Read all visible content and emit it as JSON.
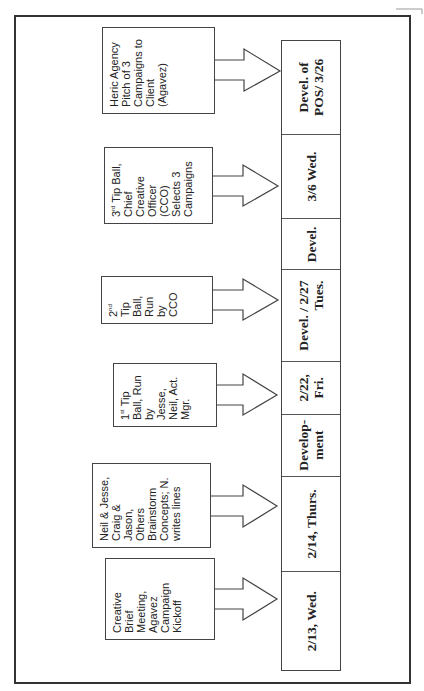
{
  "diagram": {
    "orientation": "rotated-90-ccw",
    "timeline": [
      {
        "label": "2/13, Wed.",
        "width": 99
      },
      {
        "label": "2/14, Thurs.",
        "width": 96
      },
      {
        "label": "Develop-\nment",
        "width": 62
      },
      {
        "label": "2/22,\nFri.",
        "width": 53
      },
      {
        "label": "Devel. / 2/27\nTues.",
        "width": 92
      },
      {
        "label": "Devel.",
        "width": 51
      },
      {
        "label": "3/6 Wed.",
        "width": 85
      },
      {
        "label": "Devel. of\nPOS/ 3/26",
        "width": 93
      }
    ],
    "events": [
      {
        "id": "creative-brief",
        "lines": [
          "Creative",
          "Brief",
          "Meeting,",
          "Agavez",
          "Campaign",
          "Kickoff"
        ],
        "target": "2/13, Wed."
      },
      {
        "id": "brainstorm",
        "lines": [
          "Neil & Jesse,",
          "Craig &",
          "Jason,",
          "Others",
          "Brainstorm",
          "Concepts; N.",
          "writes lines"
        ],
        "target": "2/14, Thurs."
      },
      {
        "id": "tip-ball-1",
        "ordinal": "1",
        "suffix": "st",
        "lines": [
          " Tip",
          "Ball, Run",
          "by",
          "Jesse,",
          "Neil, Act.",
          "Mgr."
        ],
        "target": "2/22, Fri."
      },
      {
        "id": "tip-ball-2",
        "ordinal": "2",
        "suffix": "nd",
        "lines": [
          "",
          "Tip",
          "Ball,",
          "Run",
          "by",
          "CCO"
        ],
        "target": "2/27 Tues."
      },
      {
        "id": "tip-ball-3",
        "ordinal": "3",
        "suffix": "rd",
        "lines": [
          " Tip Ball,",
          "Chief",
          "Creative",
          "Officer",
          "(CCO)",
          "Selects 3",
          "Campaigns"
        ],
        "target": "3/6 Wed."
      },
      {
        "id": "agency-pitch",
        "lines": [
          "Heric Agency",
          "Pitch of 3",
          "Campaigns to",
          "Client",
          "(Agavez)"
        ],
        "target": "Devel. of POS/ 3/26"
      }
    ]
  }
}
